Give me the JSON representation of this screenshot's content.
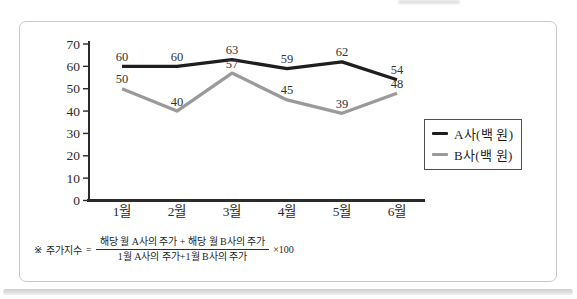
{
  "chart_data": {
    "type": "line",
    "title": "",
    "categories": [
      "1월",
      "2월",
      "3월",
      "4월",
      "5월",
      "6월"
    ],
    "series": [
      {
        "name": "A사(백 원)",
        "color": "#1e1e1e",
        "values": [
          60,
          60,
          63,
          59,
          62,
          54
        ]
      },
      {
        "name": "B사(백 원)",
        "color": "#9a9a9a",
        "values": [
          50,
          40,
          57,
          45,
          39,
          48
        ]
      }
    ],
    "ylim": [
      0,
      70
    ],
    "yticks": [
      0,
      10,
      20,
      30,
      40,
      50,
      60,
      70
    ],
    "grid": false,
    "legend_position": "right-middle",
    "show_point_labels": true,
    "axis_color": "#2b2b2b"
  },
  "footnote": {
    "marker": "※",
    "label": "주가지수",
    "equals": "=",
    "fraction": {
      "numerator": "해당 월 A사의 주가 + 해당 월 B사의 주가",
      "denominator": "1월 A사의 주가+1월 B사의 주가"
    },
    "suffix": "×100"
  }
}
